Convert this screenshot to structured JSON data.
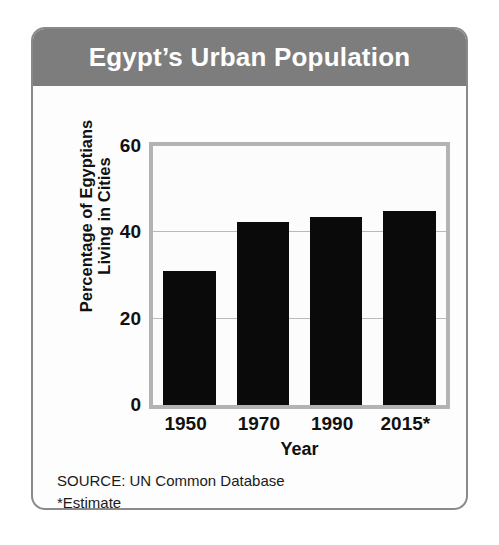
{
  "card": {
    "title": "Egypt’s Urban Population",
    "title_band_color": "#7d7d7d",
    "border_color": "#8a8a8a",
    "background_color": "#fdfdfd"
  },
  "footnotes": {
    "source": "SOURCE: UN Common Database",
    "estimate_note": "*Estimate"
  },
  "chart_data": {
    "type": "bar",
    "title": "Egypt’s Urban Population",
    "categories": [
      "1950",
      "1970",
      "1990",
      "2015*"
    ],
    "values": [
      31,
      42.5,
      43.5,
      45
    ],
    "xlabel": "Year",
    "ylabel_line1": "Percentage of Egyptians",
    "ylabel_line2": "Living in Cities",
    "ylim": [
      0,
      60
    ],
    "yticks": [
      0,
      20,
      40,
      60
    ],
    "ytick_labels": [
      "0",
      "20",
      "40",
      "60"
    ],
    "grid": true,
    "gridlines_at": [
      20,
      40
    ],
    "legend": "none",
    "bar_color": "#0a0a0a",
    "plot_frame_color": "#b3b3b3",
    "gridline_color": "#b9b9b9"
  }
}
